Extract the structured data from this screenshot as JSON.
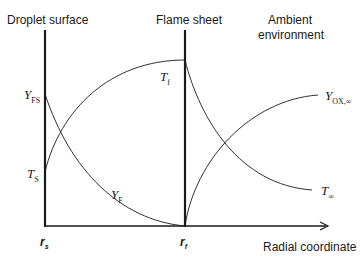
{
  "headers": {
    "droplet_surface": "Droplet surface",
    "flame_sheet": "Flame sheet",
    "ambient_line1": "Ambient",
    "ambient_line2": "environment"
  },
  "axis": {
    "x_label": "Radial coordinate",
    "r_s": {
      "base": "r",
      "sub": "s"
    },
    "r_f": {
      "base": "r",
      "sub": "f"
    }
  },
  "curve_labels": {
    "T_f": {
      "base": "T",
      "sub": "f"
    },
    "T_s": {
      "base": "T",
      "sub": "S"
    },
    "Y_FS": {
      "base": "Y",
      "sub": "FS"
    },
    "Y_F": {
      "base": "Y",
      "sub": "F"
    },
    "Y_OX_inf": {
      "base": "Y",
      "sub": "OX,∞"
    },
    "T_inf": {
      "base": "T",
      "sub": "∞"
    }
  },
  "colors": {
    "line": "#1a1a1a",
    "background": "#ffffff"
  }
}
